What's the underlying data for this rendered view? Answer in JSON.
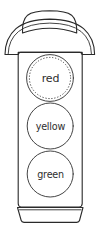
{
  "figure": {
    "style": "hand-drawn line art",
    "background_color": "#ffffff",
    "ink_color": "#2a2a2a"
  },
  "traffic_light": {
    "housing_label": "traffic light housing",
    "top_cap_label": "rounded top cap",
    "hood_label": "visor hood",
    "base_label": "base plate",
    "lamps": [
      {
        "id": "lamp-red",
        "text": "red",
        "position": "top",
        "border_style": "dotted",
        "color_name": "red",
        "color_hex": "#ffffff"
      },
      {
        "id": "lamp-yellow",
        "text": "yellow",
        "position": "middle",
        "border_style": "solid",
        "color_name": "yellow",
        "color_hex": "#ffffff"
      },
      {
        "id": "lamp-green",
        "text": "green",
        "position": "bottom",
        "border_style": "solid",
        "color_name": "green",
        "color_hex": "#ffffff"
      }
    ]
  }
}
